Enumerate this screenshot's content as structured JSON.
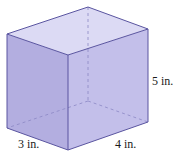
{
  "figure": {
    "type": "rectangular prism",
    "labels": {
      "depth": "3 in.",
      "width": "4 in.",
      "height": "5 in."
    },
    "colors": {
      "front_face": "#b3aee0",
      "right_face": "#c3bfea",
      "top_face": "#dcdaf4",
      "edge": "#5a55a0",
      "hidden_edge": "#8c88c4"
    }
  }
}
